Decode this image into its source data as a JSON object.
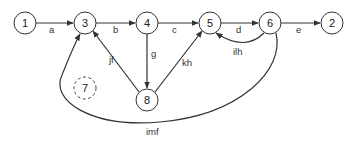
{
  "diagram": {
    "nodes": [
      {
        "id": "1",
        "label": "1",
        "x": 25,
        "y": 23,
        "style": "solid"
      },
      {
        "id": "3",
        "label": "3",
        "x": 85,
        "y": 23,
        "style": "solid"
      },
      {
        "id": "4",
        "label": "4",
        "x": 147,
        "y": 23,
        "style": "solid"
      },
      {
        "id": "5",
        "label": "5",
        "x": 210,
        "y": 23,
        "style": "solid"
      },
      {
        "id": "6",
        "label": "6",
        "x": 270,
        "y": 23,
        "style": "solid"
      },
      {
        "id": "2",
        "label": "2",
        "x": 332,
        "y": 23,
        "style": "solid"
      },
      {
        "id": "7",
        "label": "7",
        "x": 85,
        "y": 88,
        "style": "dashed"
      },
      {
        "id": "8",
        "label": "8",
        "x": 147,
        "y": 100,
        "style": "solid"
      }
    ],
    "edges": [
      {
        "from": "1",
        "to": "3",
        "label": "a"
      },
      {
        "from": "3",
        "to": "4",
        "label": "b"
      },
      {
        "from": "4",
        "to": "5",
        "label": "c"
      },
      {
        "from": "5",
        "to": "6",
        "label": "d"
      },
      {
        "from": "6",
        "to": "2",
        "label": "e"
      },
      {
        "from": "4",
        "to": "8",
        "label": "g"
      },
      {
        "from": "8",
        "to": "3",
        "label": "jf"
      },
      {
        "from": "8",
        "to": "5",
        "label": "kh"
      },
      {
        "from": "6",
        "to": "5",
        "label": "ilh"
      },
      {
        "from": "6",
        "to": "3",
        "label": "imf"
      }
    ]
  },
  "labels": {
    "n1": "1",
    "n2": "2",
    "n3": "3",
    "n4": "4",
    "n5": "5",
    "n6": "6",
    "n7": "7",
    "n8": "8",
    "a": "a",
    "b": "b",
    "c": "c",
    "d": "d",
    "e": "e",
    "g": "g",
    "jf": "jf",
    "kh": "kh",
    "ilh": "ilh",
    "imf": "imf"
  },
  "colors": {
    "stroke": "#333333",
    "background": "#ffffff"
  }
}
